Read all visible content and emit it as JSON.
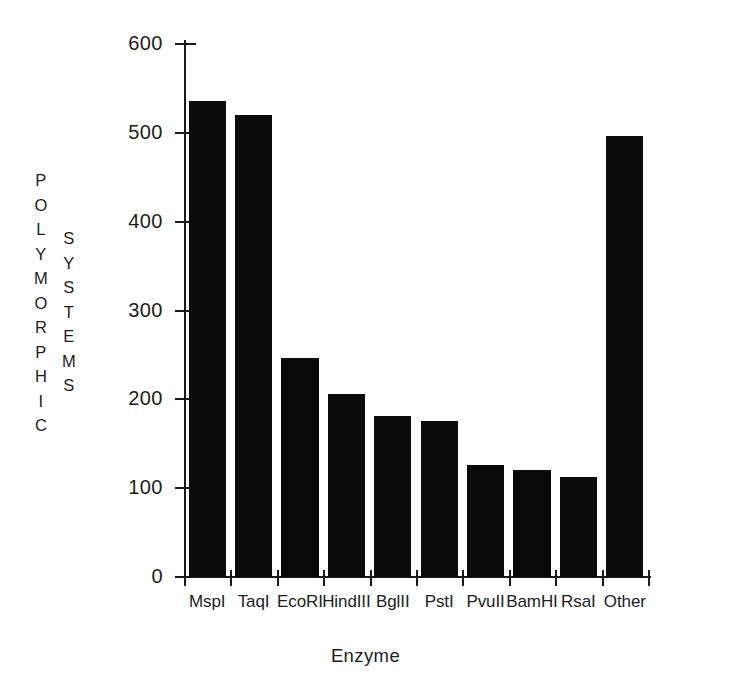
{
  "chart_data": {
    "type": "bar",
    "title": "",
    "xlabel": "Enzyme",
    "ylabel": "POLYMORPHIC SYSTEMS",
    "ylabel_columns": [
      "POLYMORPHIC",
      "SYSTEMS"
    ],
    "categories": [
      "MspI",
      "TaqI",
      "EcoRI",
      "HindIII",
      "BglII",
      "PstI",
      "PvuII",
      "BamHI",
      "RsaI",
      "Other"
    ],
    "values": [
      536,
      520,
      247,
      206,
      181,
      176,
      126,
      120,
      113,
      497
    ],
    "ylim": [
      0,
      600
    ],
    "yticks": [
      0,
      100,
      200,
      300,
      400,
      500,
      600
    ],
    "ytick_labels": [
      "0",
      "100",
      "200",
      "300",
      "400",
      "500",
      "600"
    ],
    "grid": false,
    "legend": null,
    "bar_color": "#0b0b0b",
    "axis_color": "#1a1a1a",
    "background_color": "#ffffff"
  }
}
